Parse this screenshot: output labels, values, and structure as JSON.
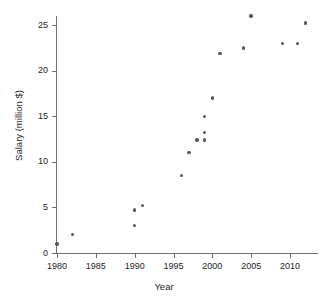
{
  "chart_data": {
    "type": "scatter",
    "title": "",
    "xlabel": "Year",
    "ylabel": "Salary (million $)",
    "xlim": [
      1978.5,
      2013.5
    ],
    "ylim": [
      0,
      26.8
    ],
    "xticks": [
      1980,
      1985,
      1990,
      1995,
      2000,
      2005,
      2010
    ],
    "xtick_labels": [
      "1980",
      "1985",
      "1990",
      "1995",
      "2000",
      "2005",
      "2010"
    ],
    "yticks": [
      0,
      5,
      10,
      15,
      20,
      25
    ],
    "ytick_labels": [
      "0",
      "5",
      "10",
      "15",
      "20",
      "25"
    ],
    "grid": false,
    "legend": false,
    "marker_color": "#58585a",
    "axis_color": "#6e6e6e",
    "points": [
      {
        "x": 1980,
        "y": 1.0
      },
      {
        "x": 1982,
        "y": 2.0
      },
      {
        "x": 1990,
        "y": 3.0
      },
      {
        "x": 1990,
        "y": 4.7
      },
      {
        "x": 1991,
        "y": 5.2
      },
      {
        "x": 1996,
        "y": 8.5
      },
      {
        "x": 1997,
        "y": 11.0
      },
      {
        "x": 1998,
        "y": 12.4
      },
      {
        "x": 1999,
        "y": 12.4
      },
      {
        "x": 1999,
        "y": 13.2
      },
      {
        "x": 1999,
        "y": 15.0
      },
      {
        "x": 2000,
        "y": 17.0
      },
      {
        "x": 2001,
        "y": 21.9
      },
      {
        "x": 2004,
        "y": 22.5
      },
      {
        "x": 2005,
        "y": 26.0
      },
      {
        "x": 2009,
        "y": 23.0
      },
      {
        "x": 2011,
        "y": 23.0
      },
      {
        "x": 2012,
        "y": 25.2
      }
    ]
  }
}
